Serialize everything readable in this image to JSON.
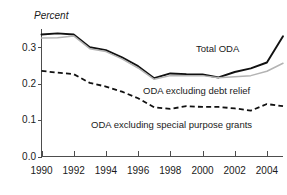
{
  "chart_data": {
    "type": "line",
    "title": "",
    "subtitle": "",
    "ylabel": "Percent",
    "xlabel": "",
    "grid": false,
    "legend_position": "inline-annotations",
    "x": [
      1990,
      1991,
      1992,
      1993,
      1994,
      1995,
      1996,
      1997,
      1998,
      1999,
      2000,
      2001,
      2002,
      2003,
      2004,
      2005
    ],
    "xlim": [
      1990,
      2005
    ],
    "ylim": [
      0.0,
      0.35
    ],
    "xticks": [
      1990,
      1992,
      1994,
      1996,
      1998,
      2000,
      2002,
      2004
    ],
    "xtick_labels": [
      "1990",
      "1992",
      "1994",
      "1996",
      "1998",
      "2000",
      "2002",
      "2004"
    ],
    "yticks": [
      0.0,
      0.1,
      0.2,
      0.3
    ],
    "ytick_labels": [
      "0.0",
      "0.1",
      "0.2",
      "0.3"
    ],
    "series": [
      {
        "name": "Total ODA",
        "style": "solid-black",
        "color": "#111111",
        "values": [
          0.335,
          0.338,
          0.335,
          0.3,
          0.292,
          0.272,
          0.248,
          0.215,
          0.228,
          0.226,
          0.225,
          0.217,
          0.232,
          0.242,
          0.258,
          0.33
        ]
      },
      {
        "name": "ODA excluding debt relief",
        "style": "solid-gray",
        "color": "#b3b3b3",
        "values": [
          0.325,
          0.326,
          0.331,
          0.296,
          0.288,
          0.268,
          0.243,
          0.212,
          0.222,
          0.222,
          0.222,
          0.216,
          0.219,
          0.222,
          0.234,
          0.256
        ]
      },
      {
        "name": "ODA excluding special purpose grants",
        "style": "dashed-black",
        "color": "#111111",
        "values": [
          0.235,
          0.23,
          0.226,
          0.202,
          0.192,
          0.178,
          0.16,
          0.135,
          0.131,
          0.138,
          0.136,
          0.136,
          0.132,
          0.126,
          0.144,
          0.138
        ]
      }
    ],
    "annotations": [
      {
        "text": "Total ODA",
        "x_px": 196,
        "y_px": 52
      },
      {
        "text": "ODA excluding debt relief",
        "x_px": 143,
        "y_px": 94
      },
      {
        "text": "ODA excluding special purpose grants",
        "x_px": 91,
        "y_px": 128
      }
    ]
  }
}
